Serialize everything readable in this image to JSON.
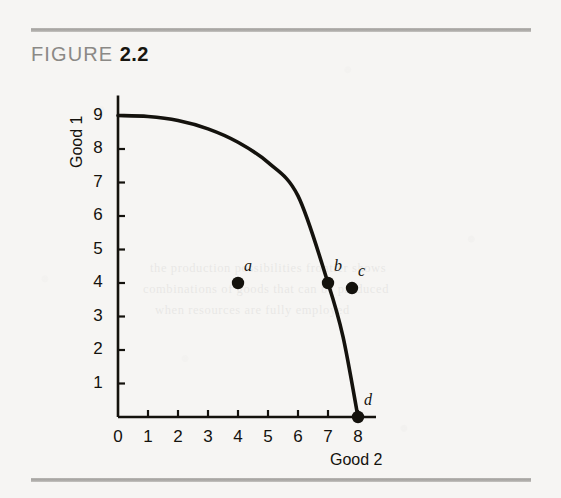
{
  "figure": {
    "word": "FIGURE",
    "number": "2.2"
  },
  "bleed_text": [
    "the production possibilities frontier shows",
    "combinations of goods that can be produced",
    "when resources are fully employed"
  ],
  "chart_data": {
    "type": "line",
    "title": "",
    "xlabel": "Good 2",
    "ylabel": "Good 1",
    "xlim": [
      0,
      8.6
    ],
    "ylim": [
      0,
      9.6
    ],
    "xticks": [
      "0",
      "1",
      "2",
      "3",
      "4",
      "5",
      "6",
      "7",
      "8"
    ],
    "yticks": [
      "1",
      "2",
      "3",
      "4",
      "5",
      "6",
      "7",
      "8",
      "9"
    ],
    "grid": false,
    "legend": "none",
    "curve": {
      "name": "Production possibilities frontier",
      "x": [
        0,
        1,
        2,
        3,
        4,
        5,
        6,
        7,
        7.5,
        8
      ],
      "y": [
        9,
        8.97,
        8.85,
        8.6,
        8.2,
        7.6,
        6.6,
        4.0,
        2.4,
        0
      ]
    },
    "points": [
      {
        "label": "a",
        "x": 4.0,
        "y": 4.0
      },
      {
        "label": "b",
        "x": 7.0,
        "y": 4.0
      },
      {
        "label": "c",
        "x": 7.8,
        "y": 3.85
      },
      {
        "label": "d",
        "x": 8.0,
        "y": 0.0
      }
    ]
  },
  "colors": {
    "ink": "#14120d",
    "rule": "#a5a3a0",
    "caption_gray": "#8b8986",
    "paper": "#f6f5f3"
  }
}
